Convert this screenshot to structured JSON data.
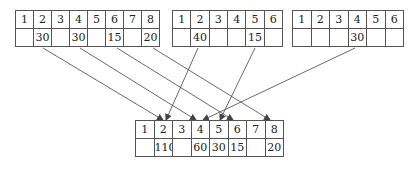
{
  "tables": {
    "top_left": {
      "indices": [
        "1",
        "2",
        "3",
        "4",
        "5",
        "6",
        "7",
        "8"
      ],
      "values": [
        "",
        "30",
        "",
        "30",
        "",
        "15",
        "",
        "20"
      ]
    },
    "top_middle": {
      "indices": [
        "1",
        "2",
        "3",
        "4",
        "5",
        "6"
      ],
      "values": [
        "",
        "40",
        "",
        "",
        "15",
        ""
      ]
    },
    "top_right": {
      "indices": [
        "1",
        "2",
        "3",
        "4",
        "5",
        "6"
      ],
      "values": [
        "",
        "",
        "",
        "30",
        "",
        ""
      ]
    },
    "bottom": {
      "indices": [
        "1",
        "2",
        "3",
        "4",
        "5",
        "6",
        "7",
        "8"
      ],
      "values": [
        "",
        "110",
        "",
        "60",
        "30",
        "15",
        "",
        "20"
      ]
    }
  },
  "arrows": [
    {
      "from": "top_left.2",
      "to": "bottom.2"
    },
    {
      "from": "top_left.4",
      "to": "bottom.4"
    },
    {
      "from": "top_left.6",
      "to": "bottom.6"
    },
    {
      "from": "top_left.8",
      "to": "bottom.8"
    },
    {
      "from": "top_middle.2",
      "to": "bottom.2"
    },
    {
      "from": "top_middle.5",
      "to": "bottom.5"
    },
    {
      "from": "top_right.4",
      "to": "bottom.4"
    }
  ],
  "colors": {
    "line": "#444444",
    "border": "#555555",
    "text": "#222222"
  }
}
